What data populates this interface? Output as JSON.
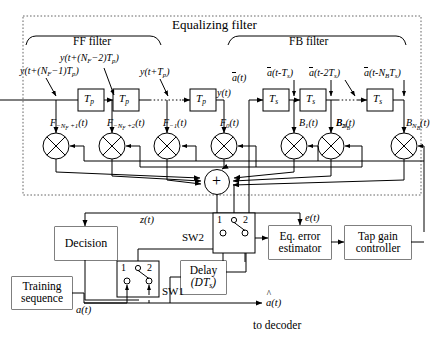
{
  "diagram": {
    "title": "Equalizing filter",
    "section_ff": "FF filter",
    "section_fb": "FB filter"
  },
  "ff_filter": {
    "delay_label": "Tp",
    "taps": [
      {
        "signal": "y(t+(N_F-1)T_p)",
        "coeff": "F_-N_F+1(t)"
      },
      {
        "signal": "y(t+(N_F-2)T_p)",
        "coeff": "F_-N_F+2(t)"
      },
      {
        "signal": "y(t+T_p)",
        "coeff": "F_-1(t)"
      },
      {
        "signal": "y(t)",
        "coeff": "F_0(t)"
      }
    ]
  },
  "fb_filter": {
    "delay_label": "Ts",
    "taps": [
      {
        "signal": "a(t)",
        "coeff": ""
      },
      {
        "signal": "a(t-T_s)",
        "coeff": "B_1(t)"
      },
      {
        "signal": "a(t-2T_s)",
        "coeff": "B_2(t)"
      },
      {
        "signal": "a(t-N_B T_s)",
        "coeff": "B_N_B(t)"
      }
    ]
  },
  "blocks": {
    "decision": "Decision",
    "training": "Training\nsequence",
    "delay": "Delay",
    "delay_arg": "(DTs)",
    "error_estimator": "Eq. error\nestimator",
    "tap_gain": "Tap gain\ncontroller"
  },
  "switches": {
    "sw1": {
      "name": "SW1",
      "pos1": "1",
      "pos2": "2"
    },
    "sw2": {
      "name": "SW2",
      "pos1": "1",
      "pos2": "2"
    }
  },
  "signals": {
    "sum_symbol": "+",
    "z": "z(t)",
    "e": "e(t)",
    "a_in": "a(t)",
    "a_hat": "a(t)",
    "to_decoder": "to decoder"
  },
  "colors": {
    "line": "#000000",
    "dashed_border": "#555555",
    "background": "#ffffff"
  }
}
